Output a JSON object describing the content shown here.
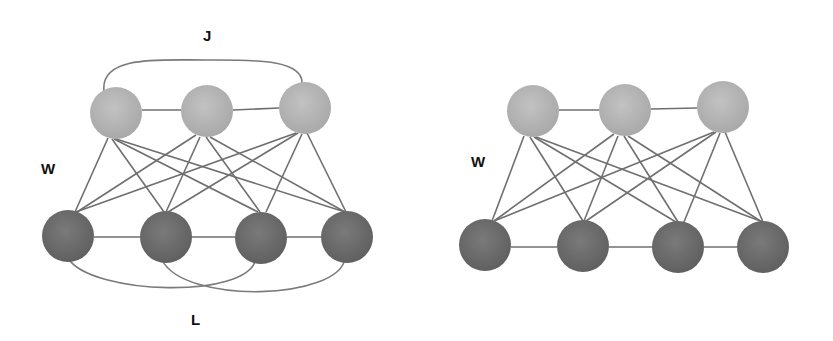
{
  "colors": {
    "hidden_node": "#b3b3b3",
    "visible_node": "#6e6e6e",
    "edge": "#6f6f6f",
    "background": "#ffffff"
  },
  "diagrams": [
    {
      "name": "boltzmann-machine",
      "labels": {
        "hidden_hidden": "J",
        "hidden_visible": "W",
        "visible_visible": "L"
      },
      "hidden_nodes": [
        [
          116,
          113
        ],
        [
          207,
          111
        ],
        [
          305,
          108
        ]
      ],
      "visible_nodes": [
        [
          68,
          236
        ],
        [
          166,
          237
        ],
        [
          261,
          236
        ],
        [
          347,
          236
        ]
      ]
    },
    {
      "name": "restricted-boltzmann-machine",
      "labels": {
        "hidden_visible": "W"
      },
      "hidden_nodes": [
        [
          533,
          111
        ],
        [
          625,
          110
        ],
        [
          723,
          107
        ]
      ],
      "visible_nodes": [
        [
          485,
          245
        ],
        [
          583,
          246
        ],
        [
          678,
          247
        ],
        [
          763,
          247
        ]
      ]
    }
  ]
}
